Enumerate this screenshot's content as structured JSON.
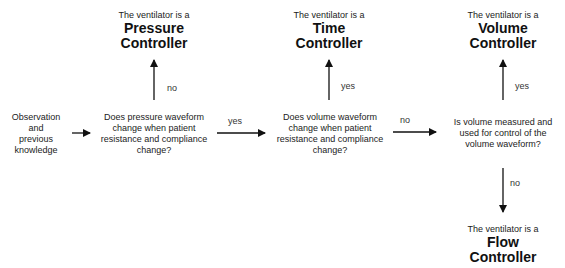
{
  "diagram": {
    "type": "flowchart",
    "start": {
      "lines": [
        "Observation",
        "and",
        "previous",
        "knowledge"
      ]
    },
    "questions": [
      {
        "id": "q1",
        "lines": [
          "Does pressure waveform",
          "change when patient",
          "resistance and compliance",
          "change?"
        ]
      },
      {
        "id": "q2",
        "lines": [
          "Does volume waveform",
          "change when patient",
          "resistance and compliance",
          "change?"
        ]
      },
      {
        "id": "q3",
        "lines": [
          "Is volume measured and",
          "used for control of the",
          "volume waveform?"
        ]
      }
    ],
    "outcomes": [
      {
        "id": "pressure",
        "prefix": "The ventilator is a",
        "title1": "Pressure",
        "title2": "Controller"
      },
      {
        "id": "time",
        "prefix": "The ventilator is a",
        "title1": "Time",
        "title2": "Controller"
      },
      {
        "id": "volume",
        "prefix": "The ventilator is a",
        "title1": "Volume",
        "title2": "Controller"
      },
      {
        "id": "flow",
        "prefix": "The ventilator is a",
        "title1": "Flow",
        "title2": "Controller"
      }
    ],
    "edges": [
      {
        "from": "start",
        "to": "q1",
        "label": ""
      },
      {
        "from": "q1",
        "to": "pressure",
        "label": "no"
      },
      {
        "from": "q1",
        "to": "q2",
        "label": "yes"
      },
      {
        "from": "q2",
        "to": "time",
        "label": "yes"
      },
      {
        "from": "q2",
        "to": "q3",
        "label": "no"
      },
      {
        "from": "q3",
        "to": "volume",
        "label": "yes"
      },
      {
        "from": "q3",
        "to": "flow",
        "label": "no"
      }
    ]
  }
}
